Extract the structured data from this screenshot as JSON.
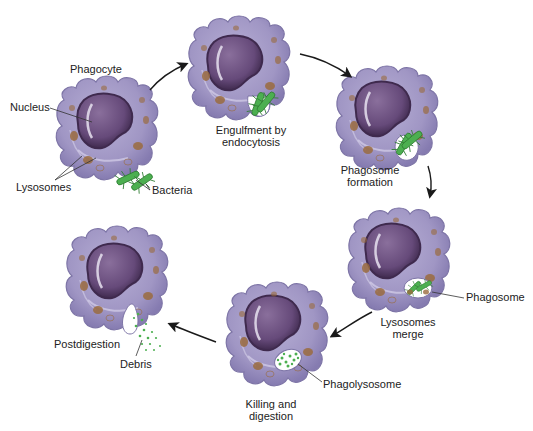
{
  "colors": {
    "cytoplasm": "#a59cc6",
    "cytoplasm_dark": "#7d74a6",
    "nucleus": "#6b4f7e",
    "nucleus_dark": "#4a3359",
    "lysosome": "#9a6b3e",
    "bacteria": "#4caf50",
    "bacteria_dark": "#2e7d32",
    "arrow": "#1a1a1a",
    "text": "#222222"
  },
  "stages": [
    {
      "id": "phagocyte",
      "label": "Phagocyte"
    },
    {
      "id": "engulfment",
      "label_line1": "Engulfment by",
      "label_line2": "endocytosis"
    },
    {
      "id": "phagosome-formation",
      "label_line1": "Phagosome",
      "label_line2": "formation"
    },
    {
      "id": "lysosomes-merge",
      "label_line1": "Lysosomes",
      "label_line2": "merge"
    },
    {
      "id": "killing-digestion",
      "label_line1": "Killing and",
      "label_line2": "digestion"
    },
    {
      "id": "postdigestion",
      "label": "Postdigestion"
    }
  ],
  "callouts": {
    "nucleus": "Nucleus",
    "lysosomes": "Lysosomes",
    "bacteria": "Bacteria",
    "phagosome": "Phagosome",
    "phagolysosome": "Phagolysosome",
    "debris": "Debris"
  }
}
